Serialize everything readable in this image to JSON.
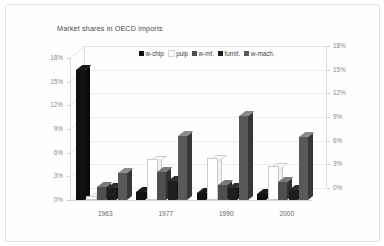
{
  "chart_data": {
    "type": "bar",
    "title": "Market shares in OECD imports",
    "xlabel": "",
    "ylabel": "",
    "ylim": [
      0,
      18
    ],
    "ytick_labels": [
      "0%",
      "3%",
      "6%",
      "9%",
      "12%",
      "15%",
      "18%"
    ],
    "ytick_values": [
      0,
      3,
      6,
      9,
      12,
      15,
      18
    ],
    "secondary_axis": {
      "position": "right",
      "ylim": [
        0,
        18
      ],
      "tick_labels": [
        "0%",
        "3%",
        "6%",
        "9%",
        "12%",
        "15%",
        "18%"
      ],
      "tick_values": [
        0,
        3,
        6,
        9,
        12,
        15,
        18
      ]
    },
    "grid": true,
    "legend_position": "top",
    "three_d": true,
    "categories": [
      "1963",
      "1977",
      "1990",
      "2000"
    ],
    "series": [
      {
        "name": "w-chip",
        "color": "#111111",
        "values": [
          16.5,
          1.0,
          0.9,
          0.8
        ]
      },
      {
        "name": "pulp",
        "color": "#ffffff",
        "values": [
          0.2,
          5.0,
          5.1,
          4.0
        ]
      },
      {
        "name": "w-mf.",
        "color": "#4f4f4f",
        "values": [
          1.7,
          3.6,
          1.9,
          2.3
        ]
      },
      {
        "name": "furnit.",
        "color": "#1e1e1e",
        "values": [
          1.5,
          2.4,
          1.5,
          1.3
        ]
      },
      {
        "name": "w-mach.",
        "color": "#595959",
        "values": [
          3.4,
          8.1,
          10.6,
          8.0
        ]
      }
    ]
  },
  "legend": {
    "items": [
      {
        "label": "w-chip",
        "color": "#111111"
      },
      {
        "label": "pulp",
        "color": "#ffffff"
      },
      {
        "label": "w-mf.",
        "color": "#4f4f4f"
      },
      {
        "label": "furnit.",
        "color": "#1e1e1e"
      },
      {
        "label": "w-mach.",
        "color": "#595959"
      }
    ]
  },
  "theme": {
    "background": "#ffffff",
    "border": "#e2e2e2",
    "grid": "#ededed",
    "axis_text": "#8a8a8a",
    "title_text": "#4a4a4a",
    "category_text": "#666666"
  }
}
